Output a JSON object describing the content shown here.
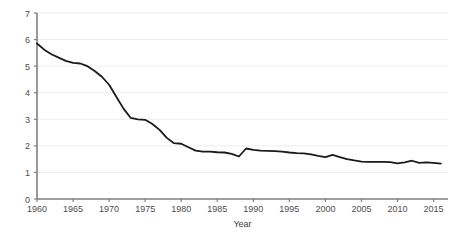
{
  "chart_data": {
    "type": "line",
    "title": "",
    "subtitle": "",
    "xlabel": "Year",
    "ylabel": "",
    "grid": true,
    "legend": false,
    "legend_position": "none",
    "line_color": "#1a1a1a",
    "line_width": 1.8,
    "gridline_color": "#ededed",
    "axis_color": "#808080",
    "tick_label_color": "#4d4d4d",
    "xlim": [
      1960,
      2017
    ],
    "ylim": [
      0,
      7
    ],
    "xticks": [
      1960,
      1965,
      1970,
      1975,
      1980,
      1985,
      1990,
      1995,
      2000,
      2005,
      2010,
      2015
    ],
    "xtick_labels": [
      "1960",
      "1965",
      "1970",
      "1975",
      "1980",
      "1985",
      "1990",
      "1995",
      "2000",
      "2005",
      "2010",
      "2015"
    ],
    "yticks": [
      0,
      1,
      2,
      3,
      4,
      5,
      6,
      7
    ],
    "ytick_labels": [
      "0",
      "1",
      "2",
      "3",
      "4",
      "5",
      "6",
      "7"
    ],
    "x": [
      1960,
      1961,
      1962,
      1963,
      1964,
      1965,
      1966,
      1967,
      1968,
      1969,
      1970,
      1971,
      1972,
      1973,
      1974,
      1975,
      1976,
      1977,
      1978,
      1979,
      1980,
      1981,
      1982,
      1983,
      1984,
      1985,
      1986,
      1987,
      1988,
      1989,
      1990,
      1991,
      1992,
      1993,
      1994,
      1995,
      1996,
      1997,
      1998,
      1999,
      2000,
      2001,
      2002,
      2003,
      2004,
      2005,
      2006,
      2007,
      2008,
      2009,
      2010,
      2011,
      2012,
      2013,
      2014,
      2015,
      2016
    ],
    "y": [
      5.85,
      5.62,
      5.45,
      5.32,
      5.2,
      5.12,
      5.1,
      5.0,
      4.82,
      4.6,
      4.3,
      3.85,
      3.4,
      3.05,
      3.0,
      2.98,
      2.82,
      2.6,
      2.3,
      2.1,
      2.08,
      1.95,
      1.82,
      1.78,
      1.78,
      1.76,
      1.75,
      1.7,
      1.6,
      1.9,
      1.85,
      1.82,
      1.81,
      1.8,
      1.78,
      1.75,
      1.73,
      1.72,
      1.68,
      1.62,
      1.58,
      1.66,
      1.58,
      1.5,
      1.45,
      1.41,
      1.4,
      1.4,
      1.4,
      1.39,
      1.34,
      1.38,
      1.44,
      1.36,
      1.38,
      1.36,
      1.33
    ],
    "series": [
      {
        "name": "",
        "values": [
          5.85,
          5.62,
          5.45,
          5.32,
          5.2,
          5.12,
          5.1,
          5.0,
          4.82,
          4.6,
          4.3,
          3.85,
          3.4,
          3.05,
          3.0,
          2.98,
          2.82,
          2.6,
          2.3,
          2.1,
          2.08,
          1.95,
          1.82,
          1.78,
          1.78,
          1.76,
          1.75,
          1.7,
          1.6,
          1.9,
          1.85,
          1.82,
          1.81,
          1.8,
          1.78,
          1.75,
          1.73,
          1.72,
          1.68,
          1.62,
          1.58,
          1.66,
          1.58,
          1.5,
          1.45,
          1.41,
          1.4,
          1.4,
          1.4,
          1.39,
          1.34,
          1.38,
          1.44,
          1.36,
          1.38,
          1.36,
          1.33
        ]
      }
    ]
  }
}
